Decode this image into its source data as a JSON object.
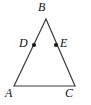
{
  "figure": {
    "type": "triangle-with-midpoints",
    "canvas": {
      "width": 91,
      "height": 105
    },
    "colors": {
      "background": "#ffffff",
      "stroke": "#3a3a3a",
      "label": "#111111",
      "point_fill": "#1a1a1a"
    },
    "stroke_width": 1.2,
    "vertices": [
      {
        "name": "B",
        "label": "B",
        "x": 46,
        "y": 19,
        "label_x": 38,
        "label_y": 1,
        "marker": false
      },
      {
        "name": "A",
        "label": "A",
        "x": 14,
        "y": 86,
        "label_x": 5,
        "label_y": 87,
        "marker": false
      },
      {
        "name": "C",
        "label": "C",
        "x": 75,
        "y": 86,
        "label_x": 65,
        "label_y": 87,
        "marker": false
      }
    ],
    "points": [
      {
        "name": "D",
        "label": "D",
        "x": 34,
        "y": 45,
        "label_x": 19,
        "label_y": 37,
        "marker": true,
        "on_segment": "AB"
      },
      {
        "name": "E",
        "label": "E",
        "x": 56,
        "y": 45,
        "label_x": 60,
        "label_y": 37,
        "marker": true,
        "on_segment": "BC"
      }
    ],
    "segments": [
      {
        "name": "side-AB",
        "from": "A",
        "to": "B"
      },
      {
        "name": "side-BC",
        "from": "B",
        "to": "C"
      },
      {
        "name": "side-AC",
        "from": "A",
        "to": "C"
      }
    ],
    "point_marker_radius": 2.1
  }
}
